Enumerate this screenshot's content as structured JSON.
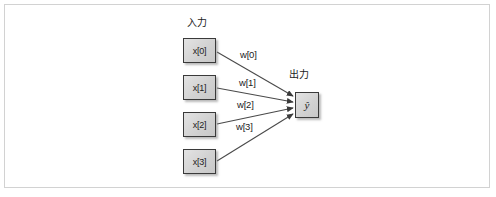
{
  "figure": {
    "type": "neural-network-perceptron-diagram",
    "background_color": "#ffffff",
    "frame_border_color": "#d2d2d2",
    "line_color": "#4a4a4a",
    "node_fill_color": "#d6d6d6",
    "node_border_color": "#3a3a3a",
    "text_color": "#1c1c1c"
  },
  "captions": {
    "input": "入力",
    "output": "出力"
  },
  "input_nodes": [
    {
      "label": "x[0]"
    },
    {
      "label": "x[1]"
    },
    {
      "label": "x[2]"
    },
    {
      "label": "x[3]"
    }
  ],
  "weights": [
    {
      "label": "w[0]"
    },
    {
      "label": "w[1]"
    },
    {
      "label": "w[2]"
    },
    {
      "label": "w[3]"
    }
  ],
  "output_node": {
    "label": "ŷ"
  }
}
